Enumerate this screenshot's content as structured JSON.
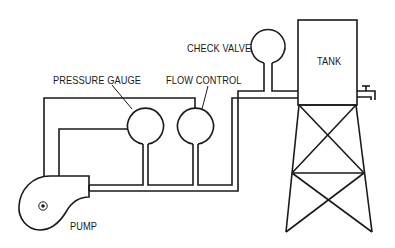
{
  "diagram": {
    "type": "hydraulic schematic",
    "components": [
      {
        "id": "pump",
        "label": "PUMP"
      },
      {
        "id": "pressure-gauge",
        "label": "PRESSURE GAUGE"
      },
      {
        "id": "flow-control",
        "label": "FLOW CONTROL"
      },
      {
        "id": "check-valve",
        "label": "CHECK VALVE"
      },
      {
        "id": "tank",
        "label": "TANK"
      }
    ],
    "labels": {
      "pump": "PUMP",
      "pressure_gauge": "PRESSURE GAUGE",
      "flow_control": "FLOW CONTROL",
      "check_valve": "CHECK VALVE",
      "tank": "TANK"
    },
    "connections": [
      {
        "from": "pump",
        "to": "pressure-gauge"
      },
      {
        "from": "pump",
        "to": "flow-control"
      },
      {
        "from": "pressure-gauge",
        "to": "pump"
      },
      {
        "from": "flow-control",
        "to": "pump"
      },
      {
        "from": "pump",
        "to": "check-valve"
      },
      {
        "from": "check-valve",
        "to": "tank"
      }
    ],
    "colors": {
      "line": "#1a1a1a",
      "background": "#ffffff"
    }
  }
}
